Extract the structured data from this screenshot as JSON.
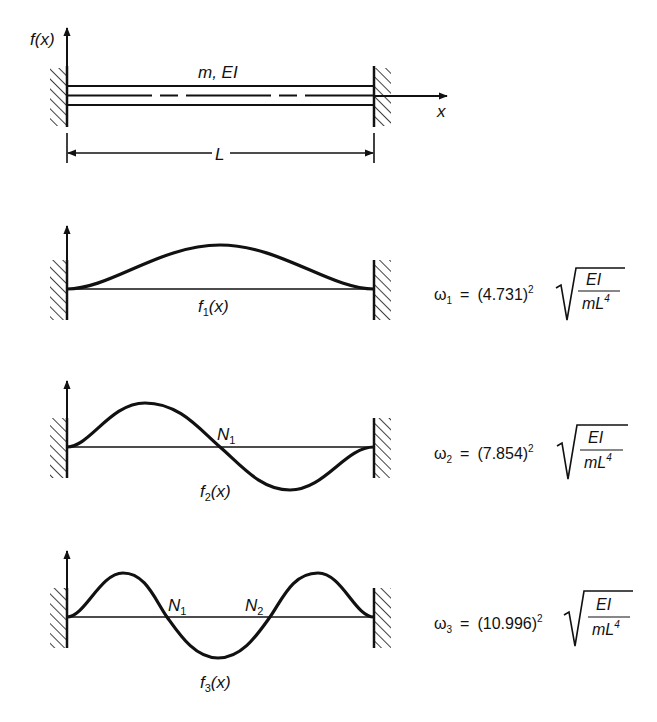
{
  "beam": {
    "axis_label_y": "f(x)",
    "axis_label_x": "x",
    "property_label": "m, EI",
    "length_label": "L",
    "boundary": "clamped-clamped"
  },
  "modes": [
    {
      "index": 1,
      "shape_label": "f",
      "shape_sub": "1",
      "shape_arg": "(x)",
      "nodes": [],
      "omega_symbol": "ω",
      "omega_sub": "1",
      "coefficient": "(4.731)",
      "power": "2",
      "numerator": "EI",
      "denominator": "mL",
      "denominator_power": "4"
    },
    {
      "index": 2,
      "shape_label": "f",
      "shape_sub": "2",
      "shape_arg": "(x)",
      "nodes": [
        {
          "label": "N",
          "sub": "1"
        }
      ],
      "omega_symbol": "ω",
      "omega_sub": "2",
      "coefficient": "(7.854)",
      "power": "2",
      "numerator": "EI",
      "denominator": "mL",
      "denominator_power": "4"
    },
    {
      "index": 3,
      "shape_label": "f",
      "shape_sub": "3",
      "shape_arg": "(x)",
      "nodes": [
        {
          "label": "N",
          "sub": "1"
        },
        {
          "label": "N",
          "sub": "2"
        }
      ],
      "omega_symbol": "ω",
      "omega_sub": "3",
      "coefficient": "(10.996)",
      "power": "2",
      "numerator": "EI",
      "denominator": "mL",
      "denominator_power": "4"
    }
  ],
  "equals": "="
}
